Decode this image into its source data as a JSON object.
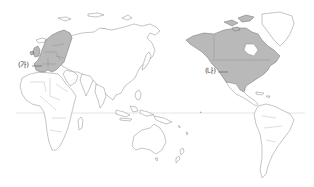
{
  "map": {
    "type": "world-map",
    "projection": "pacific-centered",
    "background": "#ffffff",
    "highlight_color": "#b9b9b9",
    "line_color": "#8a8a8a",
    "equator_color": "#d4d4d4",
    "regions": [
      {
        "id": "ga",
        "label": "(가)",
        "region": "Europe (EU member states)",
        "highlighted": true
      },
      {
        "id": "na",
        "label": "(나)",
        "region": "North America (Canada, United States)",
        "highlighted": true
      }
    ],
    "lines": [
      {
        "name": "equator",
        "y": 113
      }
    ]
  },
  "labels": {
    "ga": "(가)",
    "na": "(나)"
  }
}
